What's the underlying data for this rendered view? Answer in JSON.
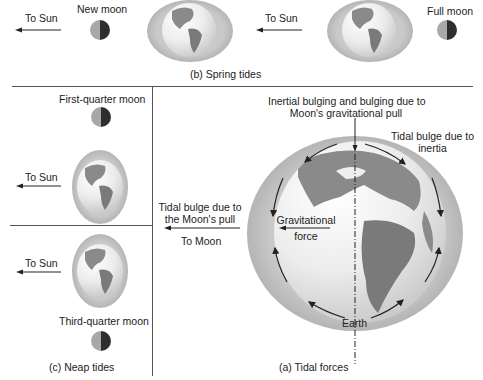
{
  "spring_tides": {
    "caption": "(b) Spring tides",
    "left": {
      "sun_label": "To Sun",
      "moon_label": "New moon"
    },
    "right": {
      "sun_label": "To Sun",
      "moon_label": "Full moon"
    }
  },
  "neap_tides": {
    "caption": "(c) Neap tides",
    "top": {
      "moon_label": "First-quarter moon",
      "sun_label": "To Sun"
    },
    "bottom": {
      "sun_label": "To Sun",
      "moon_label": "Third-quarter moon"
    }
  },
  "tidal_forces": {
    "caption": "(a) Tidal forces",
    "top_label_line1": "Inertial bulging and bulging due to",
    "top_label_line2": "Moon's gravitational pull",
    "inertia_label_line1": "Tidal bulge due to",
    "inertia_label_line2": "inertia",
    "moon_pull_label_line1": "Tidal bulge due to",
    "moon_pull_label_line2": "the Moon's pull",
    "to_moon_label": "To Moon",
    "grav_label_line1": "Gravitational",
    "grav_label_line2": "force",
    "earth_label": "Earth"
  },
  "colors": {
    "moon_lit": "#a8a8a8",
    "moon_dark": "#2e2e2e",
    "bulge": "#b5b5b5",
    "ocean": "#ececec",
    "land": "#8a8a8a",
    "divider": "#555555"
  }
}
